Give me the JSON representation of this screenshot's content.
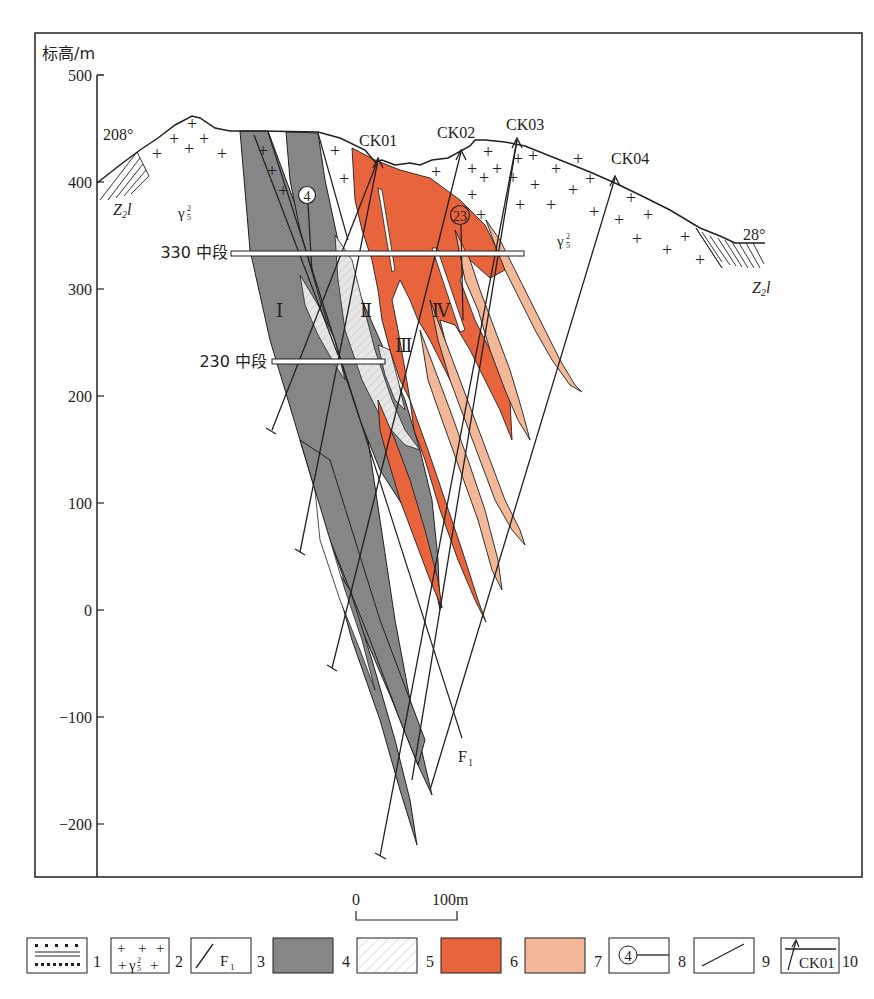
{
  "figure": {
    "type": "geological cross-section",
    "y_axis": {
      "title": "标高/m",
      "ticks": [
        {
          "label": "500",
          "value": 500
        },
        {
          "label": "400",
          "value": 400
        },
        {
          "label": "300",
          "value": 300
        },
        {
          "label": "200",
          "value": 200
        },
        {
          "label": "100",
          "value": 100
        },
        {
          "label": "0",
          "value": 0
        },
        {
          "label": "−100",
          "value": -100
        },
        {
          "label": "−200",
          "value": -200
        }
      ]
    },
    "azimuths": {
      "left": "208°",
      "right": "28°"
    },
    "strata": {
      "left_label": "Z",
      "left_sub": "2",
      "left_suffix": "l",
      "right_label": "Z",
      "right_sub": "2",
      "right_suffix": "l"
    },
    "granite": {
      "symbol": "γ",
      "sup": "2",
      "sub": "5"
    },
    "levels": [
      {
        "label": "330 中段",
        "elevation": 330
      },
      {
        "label": "230 中段",
        "elevation": 230
      }
    ],
    "drillholes": [
      {
        "label": "CK01"
      },
      {
        "label": "CK02"
      },
      {
        "label": "CK03"
      },
      {
        "label": "CK04"
      }
    ],
    "ore_bodies": [
      {
        "label": "Ⅰ"
      },
      {
        "label": "Ⅱ"
      },
      {
        "label": "Ⅲ"
      },
      {
        "label": "Ⅳ"
      }
    ],
    "exploration_lines": [
      {
        "label": "4"
      },
      {
        "label": "23"
      }
    ],
    "fault": {
      "label": "F",
      "sub": "1"
    },
    "scale_bar": {
      "start": "0",
      "end": "100m"
    },
    "colors": {
      "dark_gray": "#8a8a8a",
      "light_gray": "#d8d8d8",
      "orange_red": "#e8643c",
      "salmon": "#f2b898",
      "line": "#231f20"
    }
  },
  "legend": {
    "items": [
      {
        "number": "1",
        "name": "sandstone-slate"
      },
      {
        "number": "2",
        "name": "granite",
        "text_sup": "2",
        "text_sub": "5"
      },
      {
        "number": "3",
        "name": "fault",
        "text": "F",
        "text_sub": "1"
      },
      {
        "number": "4",
        "name": "dark-gray-zone"
      },
      {
        "number": "5",
        "name": "light-gray-hatched-zone"
      },
      {
        "number": "6",
        "name": "orange-red-zone"
      },
      {
        "number": "7",
        "name": "salmon-zone"
      },
      {
        "number": "8",
        "name": "exploration-line",
        "text": "4"
      },
      {
        "number": "9",
        "name": "geological-boundary"
      },
      {
        "number": "10",
        "name": "drillhole",
        "text": "CK01"
      }
    ]
  }
}
